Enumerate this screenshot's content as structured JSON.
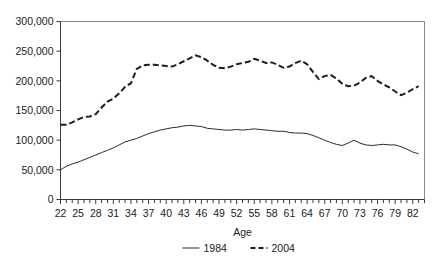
{
  "chart_data": {
    "type": "line",
    "title": "",
    "xlabel": "Age",
    "ylabel": "",
    "grid": false,
    "legend_position": "bottom",
    "xlim": [
      22,
      84
    ],
    "ylim": [
      0,
      300000
    ],
    "x": [
      22,
      23,
      24,
      25,
      26,
      27,
      28,
      29,
      30,
      31,
      32,
      33,
      34,
      35,
      36,
      37,
      38,
      39,
      40,
      41,
      42,
      43,
      44,
      45,
      46,
      47,
      48,
      49,
      50,
      51,
      52,
      53,
      54,
      55,
      56,
      57,
      58,
      59,
      60,
      61,
      62,
      63,
      64,
      65,
      66,
      67,
      68,
      69,
      70,
      71,
      72,
      73,
      74,
      75,
      76,
      77,
      78,
      79,
      80,
      81,
      82,
      83
    ],
    "xtick_labels": [
      "22",
      "25",
      "28",
      "31",
      "34",
      "37",
      "40",
      "43",
      "46",
      "49",
      "52",
      "55",
      "58",
      "61",
      "64",
      "67",
      "70",
      "73",
      "76",
      "79",
      "82"
    ],
    "xtick_values": [
      22,
      25,
      28,
      31,
      34,
      37,
      40,
      43,
      46,
      49,
      52,
      55,
      58,
      61,
      64,
      67,
      70,
      73,
      76,
      79,
      82
    ],
    "ytick_labels": [
      "0",
      "50,000",
      "100,000",
      "150,000",
      "200,000",
      "250,000",
      "300,000"
    ],
    "ytick_values": [
      0,
      50000,
      100000,
      150000,
      200000,
      250000,
      300000
    ],
    "series": [
      {
        "name": "1984",
        "style": "solid",
        "color": "#2b2b2b",
        "values": [
          50000,
          56000,
          60000,
          63000,
          67000,
          71000,
          75000,
          79000,
          83000,
          87000,
          92000,
          97000,
          100000,
          103000,
          107000,
          111000,
          114000,
          117000,
          119000,
          121000,
          122000,
          124000,
          125000,
          124000,
          123000,
          120000,
          119000,
          118000,
          117000,
          117000,
          118000,
          117000,
          118000,
          119000,
          118000,
          117000,
          116000,
          115000,
          115000,
          113000,
          112000,
          112000,
          111000,
          108000,
          104000,
          100000,
          96000,
          93000,
          91000,
          95000,
          100000,
          95000,
          92000,
          91000,
          92000,
          93000,
          92000,
          92000,
          89000,
          85000,
          80000,
          77000
        ]
      },
      {
        "name": "2004",
        "style": "dashed",
        "color": "#1d1d1d",
        "values": [
          126000,
          126000,
          130000,
          135000,
          139000,
          140000,
          144000,
          155000,
          165000,
          170000,
          179000,
          190000,
          196000,
          220000,
          226000,
          227000,
          227000,
          226000,
          225000,
          224000,
          228000,
          233000,
          238000,
          243000,
          240000,
          234000,
          227000,
          222000,
          221000,
          224000,
          228000,
          230000,
          232000,
          237000,
          234000,
          230000,
          231000,
          227000,
          222000,
          224000,
          230000,
          234000,
          228000,
          215000,
          203000,
          208000,
          210000,
          204000,
          195000,
          191000,
          192000,
          197000,
          205000,
          208000,
          200000,
          194000,
          189000,
          182000,
          176000,
          180000,
          186000,
          191000
        ]
      }
    ]
  },
  "axis_title": "Age",
  "legend": {
    "items": [
      {
        "label": "1984",
        "style": "solid"
      },
      {
        "label": "2004",
        "style": "dashed"
      }
    ]
  }
}
